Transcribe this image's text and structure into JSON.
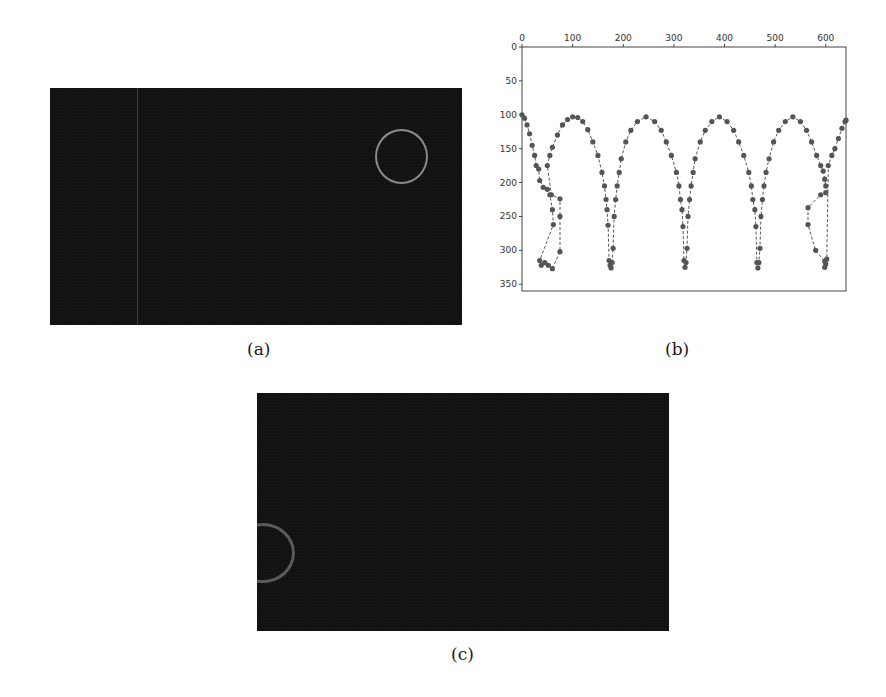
{
  "figure": {
    "panels": [
      {
        "id": "a",
        "caption": "(a)",
        "description": "dark video frame with a light grey ring at upper right and a faint vertical line"
      },
      {
        "id": "b",
        "caption": "(b)",
        "description": "scatter plot of tracked ball positions"
      },
      {
        "id": "c",
        "caption": "(c)",
        "description": "dark video frame with a grey ring partially cut at left edge"
      }
    ]
  },
  "chart_data": {
    "type": "scatter",
    "title": "",
    "xlabel": "",
    "ylabel": "",
    "x_ticks": [
      0,
      100,
      200,
      300,
      400,
      500,
      600
    ],
    "y_ticks": [
      0,
      50,
      100,
      150,
      200,
      250,
      300,
      350
    ],
    "xlim": [
      0,
      640
    ],
    "ylim": [
      360,
      0
    ],
    "y_inverted": true,
    "x_axis_position": "top",
    "grid": false,
    "legend": null,
    "marker_color": "#555555",
    "line_style": "dashed",
    "series": [
      {
        "name": "trajectory",
        "description": "bouncing arcs: peaks at y≈103 near x≈100,245,390,535; bounces at y≈325 near x≈20-60,170,320,465,600",
        "points": [
          [
            0,
            100
          ],
          [
            5,
            105
          ],
          [
            10,
            115
          ],
          [
            15,
            128
          ],
          [
            20,
            145
          ],
          [
            25,
            160
          ],
          [
            28,
            175
          ],
          [
            33,
            180
          ],
          [
            35,
            197
          ],
          [
            42,
            207
          ],
          [
            50,
            210
          ],
          [
            55,
            218
          ],
          [
            60,
            240
          ],
          [
            62,
            262
          ],
          [
            35,
            315
          ],
          [
            38,
            322
          ],
          [
            45,
            318
          ],
          [
            52,
            322
          ],
          [
            60,
            327
          ],
          [
            75,
            302
          ],
          [
            75,
            250
          ],
          [
            75,
            224
          ],
          [
            58,
            218
          ],
          [
            50,
            175
          ],
          [
            55,
            160
          ],
          [
            60,
            148
          ],
          [
            70,
            130
          ],
          [
            80,
            115
          ],
          [
            90,
            107
          ],
          [
            100,
            103
          ],
          [
            110,
            104
          ],
          [
            120,
            110
          ],
          [
            130,
            122
          ],
          [
            140,
            140
          ],
          [
            150,
            160
          ],
          [
            158,
            185
          ],
          [
            163,
            205
          ],
          [
            166,
            225
          ],
          [
            168,
            240
          ],
          [
            170,
            263
          ],
          [
            172,
            315
          ],
          [
            174,
            322
          ],
          [
            176,
            326
          ],
          [
            178,
            318
          ],
          [
            180,
            297
          ],
          [
            182,
            250
          ],
          [
            185,
            225
          ],
          [
            188,
            205
          ],
          [
            192,
            185
          ],
          [
            196,
            165
          ],
          [
            205,
            140
          ],
          [
            215,
            123
          ],
          [
            228,
            110
          ],
          [
            245,
            103
          ],
          [
            262,
            110
          ],
          [
            275,
            123
          ],
          [
            285,
            140
          ],
          [
            295,
            160
          ],
          [
            305,
            185
          ],
          [
            310,
            205
          ],
          [
            313,
            225
          ],
          [
            316,
            240
          ],
          [
            318,
            265
          ],
          [
            320,
            315
          ],
          [
            322,
            325
          ],
          [
            324,
            318
          ],
          [
            326,
            297
          ],
          [
            328,
            250
          ],
          [
            331,
            225
          ],
          [
            334,
            205
          ],
          [
            338,
            185
          ],
          [
            342,
            165
          ],
          [
            352,
            140
          ],
          [
            362,
            123
          ],
          [
            375,
            110
          ],
          [
            390,
            103
          ],
          [
            405,
            110
          ],
          [
            418,
            123
          ],
          [
            428,
            140
          ],
          [
            438,
            160
          ],
          [
            448,
            185
          ],
          [
            453,
            205
          ],
          [
            456,
            225
          ],
          [
            460,
            240
          ],
          [
            462,
            265
          ],
          [
            464,
            318
          ],
          [
            466,
            326
          ],
          [
            468,
            318
          ],
          [
            470,
            297
          ],
          [
            472,
            250
          ],
          [
            475,
            225
          ],
          [
            478,
            205
          ],
          [
            482,
            185
          ],
          [
            488,
            165
          ],
          [
            497,
            140
          ],
          [
            507,
            123
          ],
          [
            520,
            110
          ],
          [
            535,
            103
          ],
          [
            550,
            110
          ],
          [
            562,
            123
          ],
          [
            572,
            140
          ],
          [
            582,
            160
          ],
          [
            590,
            175
          ],
          [
            595,
            183
          ],
          [
            598,
            195
          ],
          [
            600,
            205
          ],
          [
            600,
            215
          ],
          [
            590,
            218
          ],
          [
            565,
            237
          ],
          [
            565,
            262
          ],
          [
            580,
            300
          ],
          [
            598,
            316
          ],
          [
            598,
            325
          ],
          [
            600,
            320
          ],
          [
            602,
            313
          ],
          [
            605,
            175
          ],
          [
            612,
            160
          ],
          [
            618,
            150
          ],
          [
            625,
            135
          ],
          [
            632,
            120
          ],
          [
            638,
            110
          ],
          [
            640,
            108
          ]
        ]
      }
    ]
  }
}
